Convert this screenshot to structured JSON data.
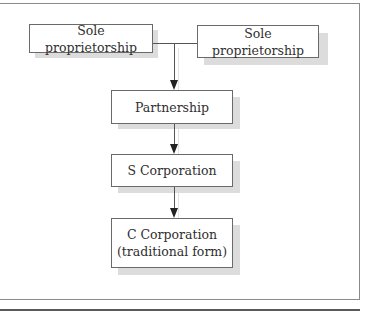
{
  "diagram": {
    "type": "flowchart",
    "nodes": [
      {
        "id": "sole1",
        "label": "Sole proprietorship"
      },
      {
        "id": "sole2",
        "label": "Sole proprietorship"
      },
      {
        "id": "partnership",
        "label": "Partnership"
      },
      {
        "id": "scorp",
        "label": "S Corporation"
      },
      {
        "id": "ccorp",
        "line1": "C Corporation",
        "line2": "(traditional form)"
      }
    ],
    "edges": [
      {
        "from": "sole1",
        "to": "partnership"
      },
      {
        "from": "sole2",
        "to": "partnership"
      },
      {
        "from": "partnership",
        "to": "scorp"
      },
      {
        "from": "scorp",
        "to": "ccorp"
      }
    ],
    "colors": {
      "box_border": "#6a6a6a",
      "shadow": "#dcdcdc",
      "line": "#555555",
      "frame": "#8a8a8a"
    }
  }
}
